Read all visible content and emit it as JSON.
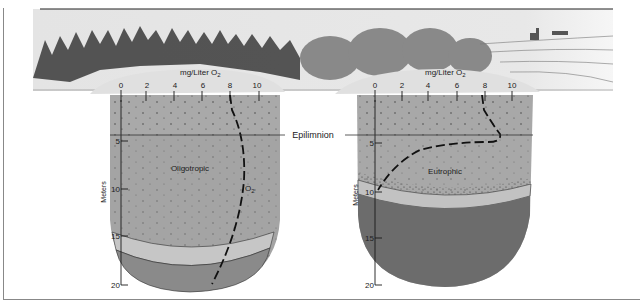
{
  "diagram": {
    "type": "lake-oxygen-profile-comparison",
    "colors": {
      "sky": "#ececec",
      "lake_surface": "#e2e2e2",
      "epilimnion": "#a9a9a9",
      "oligo_water": "#a3a3a3",
      "oligo_band": "#c4c4c4",
      "oligo_bottom": "#8a8a8a",
      "eutro_water": "#a8a8a8",
      "eutro_band": "#c2c2c2",
      "eutro_bottom": "#6c6c6c",
      "line": "#1a1a1a"
    },
    "shared_label": "Epilimnion",
    "lakes": [
      {
        "name": "Oligotropic",
        "x_axis_label": "mg/Liter O",
        "x_axis_subscript": "2",
        "x_ticks": [
          "0",
          "2",
          "4",
          "6",
          "8",
          "10"
        ],
        "y_axis_label": "Meters",
        "y_ticks": [
          "5",
          "10",
          "15",
          "20"
        ],
        "curve_label": "O",
        "curve_subscript": "2",
        "o2_profile": [
          {
            "depth_m": 0,
            "mg_per_l": 8.0
          },
          {
            "depth_m": 3,
            "mg_per_l": 7.6
          },
          {
            "depth_m": 5,
            "mg_per_l": 7.3
          },
          {
            "depth_m": 10,
            "mg_per_l": 7.0
          },
          {
            "depth_m": 15,
            "mg_per_l": 6.5
          },
          {
            "depth_m": 20,
            "mg_per_l": 5.5
          }
        ]
      },
      {
        "name": "Eutrophic",
        "x_axis_label": "mg/Liter O",
        "x_axis_subscript": "2",
        "x_ticks": [
          "0",
          "2",
          "4",
          "6",
          "8",
          "10"
        ],
        "y_axis_label": "Meters",
        "y_ticks": [
          "5",
          "10",
          "15",
          "20"
        ],
        "o2_profile": [
          {
            "depth_m": 0,
            "mg_per_l": 8.0
          },
          {
            "depth_m": 3,
            "mg_per_l": 8.8
          },
          {
            "depth_m": 4.5,
            "mg_per_l": 8.0
          },
          {
            "depth_m": 5,
            "mg_per_l": 5.0
          },
          {
            "depth_m": 7,
            "mg_per_l": 2.5
          },
          {
            "depth_m": 10,
            "mg_per_l": 0.0
          }
        ]
      }
    ]
  }
}
